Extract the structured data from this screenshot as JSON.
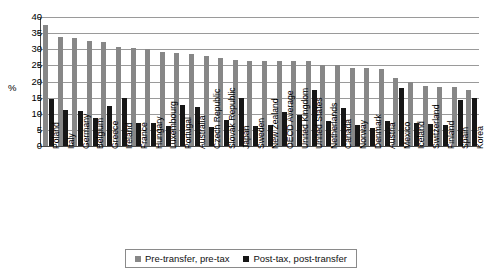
{
  "chart_data": {
    "type": "bar",
    "title": "",
    "xlabel": "",
    "ylabel": "%",
    "ylim": [
      0,
      40
    ],
    "ytick_step": 5,
    "yticks": [
      40,
      35,
      30,
      25,
      20,
      15,
      10,
      5,
      0
    ],
    "grid": true,
    "legend_position": "bottom",
    "categories": [
      "Poland",
      "Italy",
      "Germany",
      "Belgium",
      "Greece",
      "Ireland",
      "France",
      "Hungary",
      "Luxembourg",
      "Portugal",
      "Australia",
      "Czech Republic",
      "Slovak Republic",
      "Japan",
      "Sweden",
      "New Zealand",
      "OECD Average",
      "United Kingdom",
      "United States",
      "Netherlands",
      "Canada",
      "Norway",
      "Denmark",
      "Austria",
      "Mexico",
      "Iceland",
      "Switzerland",
      "Finland",
      "Spain",
      "Korea"
    ],
    "series": [
      {
        "name": "Pre-transfer, pre-tax",
        "color": "#878787",
        "values": [
          37.5,
          33.8,
          33.6,
          32.7,
          32.4,
          30.7,
          30.5,
          30.0,
          29.0,
          28.8,
          28.5,
          28.0,
          27.2,
          26.7,
          26.5,
          26.5,
          26.5,
          26.5,
          26.5,
          25.2,
          25.0,
          24.3,
          24.2,
          24.0,
          21.0,
          20.0,
          18.7,
          18.3,
          18.2,
          17.5
        ]
      },
      {
        "name": "Post-tax, post-transfer",
        "color": "#161616",
        "values": [
          14.6,
          11.3,
          10.8,
          8.7,
          12.4,
          14.8,
          7.0,
          7.0,
          6.1,
          12.8,
          12.2,
          5.8,
          8.0,
          14.8,
          6.2,
          6.4,
          10.6,
          9.5,
          17.5,
          7.7,
          11.9,
          6.4,
          5.5,
          7.7,
          18.0,
          7.0,
          6.7,
          6.4,
          14.2,
          15.0
        ]
      }
    ]
  },
  "legend": {
    "items": [
      {
        "label": "Pre-transfer, pre-tax"
      },
      {
        "label": "Post-tax, post-transfer"
      }
    ]
  }
}
